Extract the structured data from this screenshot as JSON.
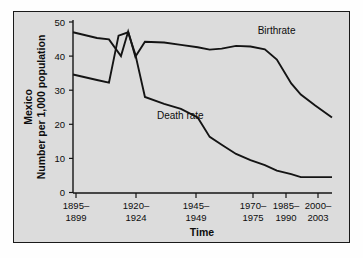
{
  "chart_data": {
    "type": "line",
    "title": "",
    "xlabel": "Time",
    "ylabel_line1": "Mexico",
    "ylabel_line2": "Number per 1,000 population",
    "categories": [
      "1895–\n1899",
      "1920–\n1924",
      "1945–\n1949",
      "1970–\n1975",
      "1985–\n1990",
      "2000–\n2003"
    ],
    "xtick_labels": [
      {
        "top": "1895–",
        "bottom": "1899"
      },
      {
        "top": "1920–",
        "bottom": "1924"
      },
      {
        "top": "1945–",
        "bottom": "1949"
      },
      {
        "top": "1970–",
        "bottom": "1975"
      },
      {
        "top": "1985–",
        "bottom": "1990"
      },
      {
        "top": "2000–",
        "bottom": "2003"
      }
    ],
    "ytick_labels": [
      "0",
      "10",
      "20",
      "30",
      "40",
      "50"
    ],
    "ylim": [
      0,
      52
    ],
    "yticks": [
      0,
      10,
      20,
      30,
      40,
      50
    ],
    "xlim": [
      1895,
      2003
    ],
    "grid": false,
    "legend_position": "inline-annotation",
    "annotations": [
      {
        "text": "Birthrate",
        "x": 1972,
        "y": 46.5
      },
      {
        "text": "Death rate",
        "x": 1930,
        "y": 21.5
      }
    ],
    "series": [
      {
        "name": "Birthrate",
        "color": "#141414",
        "x": [
          1895,
          1905,
          1910,
          1915,
          1918,
          1921,
          1925,
          1933,
          1940,
          1947,
          1952,
          1957,
          1963,
          1969,
          1975,
          1980,
          1986,
          1990,
          1996,
          2003
        ],
        "values": [
          47.0,
          45.3,
          44.9,
          40.0,
          47.2,
          39.8,
          44.2,
          44.0,
          43.3,
          42.6,
          41.9,
          42.2,
          43.0,
          42.8,
          42.0,
          39.0,
          32.0,
          28.7,
          25.5,
          22.0
        ]
      },
      {
        "name": "Death rate",
        "color": "#141414",
        "x": [
          1895,
          1905,
          1910,
          1914,
          1918,
          1921,
          1925,
          1933,
          1940,
          1947,
          1952,
          1957,
          1963,
          1969,
          1975,
          1980,
          1986,
          1990,
          1996,
          2003
        ],
        "values": [
          34.6,
          33.0,
          32.2,
          46.0,
          47.0,
          40.5,
          28.0,
          26.0,
          24.5,
          22.0,
          16.3,
          14.0,
          11.3,
          9.5,
          8.0,
          6.4,
          5.4,
          4.5,
          4.5,
          4.5
        ]
      }
    ]
  }
}
